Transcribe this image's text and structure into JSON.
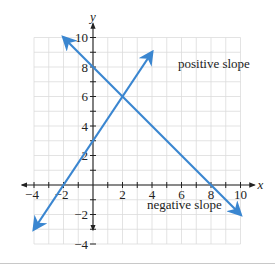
{
  "chart_data": {
    "type": "line",
    "title": "",
    "xlabel": "x",
    "ylabel": "y",
    "xlim": [
      -4,
      10
    ],
    "ylim": [
      -4,
      10
    ],
    "grid": true,
    "x_ticks": [
      -4,
      -2,
      2,
      4,
      6,
      8,
      10
    ],
    "x_tick_labels": [
      "−4",
      "−2",
      "2",
      "4",
      "6",
      "8",
      "10"
    ],
    "y_ticks": [
      -4,
      -2,
      2,
      4,
      6,
      8,
      10
    ],
    "y_tick_labels": [
      "−4",
      "−2",
      "2",
      "4",
      "6",
      "8",
      "10"
    ],
    "series": [
      {
        "name": "positive slope",
        "equation": "y = 1.5x + 3",
        "points": [
          [
            -4,
            -3
          ],
          [
            -2,
            0
          ],
          [
            2,
            6
          ],
          [
            4,
            9
          ]
        ],
        "color": "#3a86d0"
      },
      {
        "name": "negative slope",
        "equation": "y = -x + 8",
        "points": [
          [
            -2,
            10
          ],
          [
            0,
            8
          ],
          [
            2,
            6
          ],
          [
            8,
            0
          ],
          [
            10,
            -2
          ]
        ],
        "color": "#3a86d0"
      }
    ],
    "annotations": [
      {
        "text": "positive slope",
        "x": 4.2,
        "y": 7.8
      },
      {
        "text": "negative slope",
        "x": 5.5,
        "y": -1.4
      }
    ],
    "intersection": [
      2,
      6
    ]
  },
  "labels": {
    "x_axis": "x",
    "y_axis": "y",
    "positive": "positive slope",
    "negative": "negative slope"
  }
}
